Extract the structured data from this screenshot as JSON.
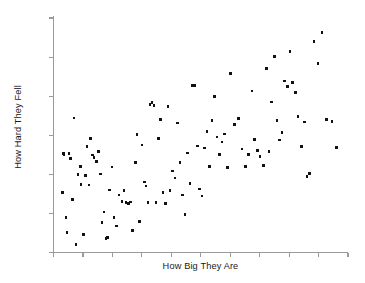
{
  "chart_data": {
    "type": "scatter",
    "title": "",
    "subtitle": "",
    "xlabel": "How Big They Are",
    "ylabel": "How Hard They Fell",
    "legend": [],
    "legend_position": "none",
    "grid": false,
    "xlim": [
      0,
      100
    ],
    "ylim": [
      0,
      100
    ],
    "xticks": [
      0,
      10,
      20,
      30,
      40,
      50,
      60,
      70,
      80,
      90,
      100
    ],
    "yticks": [
      0,
      16.7,
      33.3,
      50,
      66.7,
      83.3,
      100
    ],
    "xtick_labels": [],
    "ytick_labels": [],
    "axis_color": "#9a9a9a",
    "point_color": "#111111",
    "background_color": "#ffffff",
    "n_points": 110,
    "correlation_note": "strong positive trend",
    "points": [
      [
        3.1,
        25.5
      ],
      [
        3.4,
        42.1
      ],
      [
        3.6,
        41.7
      ],
      [
        4.2,
        14.9
      ],
      [
        4.6,
        8.6
      ],
      [
        5.3,
        42.3
      ],
      [
        5.8,
        40.0
      ],
      [
        6.4,
        22.6
      ],
      [
        6.9,
        57.4
      ],
      [
        7.6,
        3.4
      ],
      [
        8.3,
        33.2
      ],
      [
        9.1,
        36.8
      ],
      [
        9.4,
        28.9
      ],
      [
        10.2,
        7.7
      ],
      [
        10.9,
        32.8
      ],
      [
        11.4,
        45.2
      ],
      [
        12.1,
        28.8
      ],
      [
        12.6,
        48.5
      ],
      [
        13.3,
        41.6
      ],
      [
        13.8,
        40.5
      ],
      [
        14.6,
        38.7
      ],
      [
        15.2,
        43.2
      ],
      [
        15.9,
        33.4
      ],
      [
        16.4,
        12.8
      ],
      [
        17.1,
        17.3
      ],
      [
        17.8,
        6.1
      ],
      [
        18.3,
        6.3
      ],
      [
        19.1,
        26.7
      ],
      [
        19.9,
        36.5
      ],
      [
        20.6,
        14.9
      ],
      [
        21.4,
        11.3
      ],
      [
        22.3,
        24.6
      ],
      [
        23.2,
        21.7
      ],
      [
        24.0,
        26.5
      ],
      [
        24.6,
        21.3
      ],
      [
        25.4,
        20.9
      ],
      [
        26.2,
        21.6
      ],
      [
        26.9,
        9.3
      ],
      [
        27.8,
        38.4
      ],
      [
        28.4,
        50.4
      ],
      [
        29.3,
        13.2
      ],
      [
        30.1,
        45.8
      ],
      [
        30.9,
        30.1
      ],
      [
        31.4,
        28.3
      ],
      [
        32.1,
        21.4
      ],
      [
        32.8,
        63.1
      ],
      [
        33.4,
        63.9
      ],
      [
        34.1,
        62.8
      ],
      [
        34.8,
        21.2
      ],
      [
        35.6,
        48.5
      ],
      [
        36.4,
        56.7
      ],
      [
        37.2,
        25.6
      ],
      [
        38.1,
        20.8
      ],
      [
        38.9,
        62.2
      ],
      [
        39.6,
        26.5
      ],
      [
        40.4,
        34.7
      ],
      [
        41.2,
        31.8
      ],
      [
        42.1,
        55.2
      ],
      [
        43.0,
        38.5
      ],
      [
        43.8,
        24.6
      ],
      [
        44.6,
        16.3
      ],
      [
        45.4,
        42.5
      ],
      [
        46.3,
        29.4
      ],
      [
        47.1,
        71.2
      ],
      [
        47.9,
        71.3
      ],
      [
        48.8,
        45.4
      ],
      [
        49.6,
        27.1
      ],
      [
        50.4,
        24.1
      ],
      [
        51.3,
        44.6
      ],
      [
        52.1,
        51.5
      ],
      [
        53.0,
        36.8
      ],
      [
        53.8,
        56.3
      ],
      [
        54.7,
        66.4
      ],
      [
        55.5,
        49.2
      ],
      [
        56.4,
        41.8
      ],
      [
        57.2,
        47.2
      ],
      [
        58.1,
        50.6
      ],
      [
        59.0,
        36.3
      ],
      [
        60.2,
        76.4
      ],
      [
        61.5,
        54.7
      ],
      [
        62.8,
        57.1
      ],
      [
        64.0,
        44.2
      ],
      [
        65.1,
        36.6
      ],
      [
        66.2,
        41.9
      ],
      [
        67.4,
        68.8
      ],
      [
        68.3,
        48.3
      ],
      [
        69.2,
        43.5
      ],
      [
        70.1,
        40.9
      ],
      [
        71.3,
        37.2
      ],
      [
        72.4,
        78.5
      ],
      [
        73.2,
        43.1
      ],
      [
        74.1,
        64.1
      ],
      [
        75.0,
        83.6
      ],
      [
        75.9,
        56.4
      ],
      [
        76.8,
        47.9
      ],
      [
        77.6,
        51.2
      ],
      [
        78.5,
        73.2
      ],
      [
        79.4,
        70.7
      ],
      [
        80.3,
        85.6
      ],
      [
        81.2,
        72.5
      ],
      [
        82.1,
        68.3
      ],
      [
        83.0,
        58.1
      ],
      [
        84.3,
        45.1
      ],
      [
        85.2,
        55.6
      ],
      [
        86.1,
        32.3
      ],
      [
        87.0,
        33.6
      ],
      [
        88.4,
        90.1
      ],
      [
        89.8,
        80.5
      ],
      [
        91.2,
        93.7
      ],
      [
        92.6,
        56.8
      ],
      [
        94.5,
        55.9
      ],
      [
        96.1,
        44.7
      ]
    ]
  }
}
